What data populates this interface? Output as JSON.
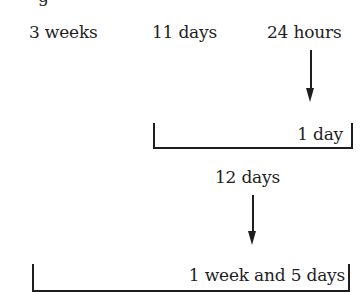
{
  "top_fragment": "g",
  "row1": {
    "items": [
      "3 weeks",
      "11 days",
      "24 hours"
    ]
  },
  "bracket1": {
    "label": "1 day"
  },
  "middle": {
    "label": "12 days"
  },
  "bracket2": {
    "label": "1 week and 5 days"
  },
  "colors": {
    "ink": "#1e1e1e",
    "background": "#ffffff"
  }
}
